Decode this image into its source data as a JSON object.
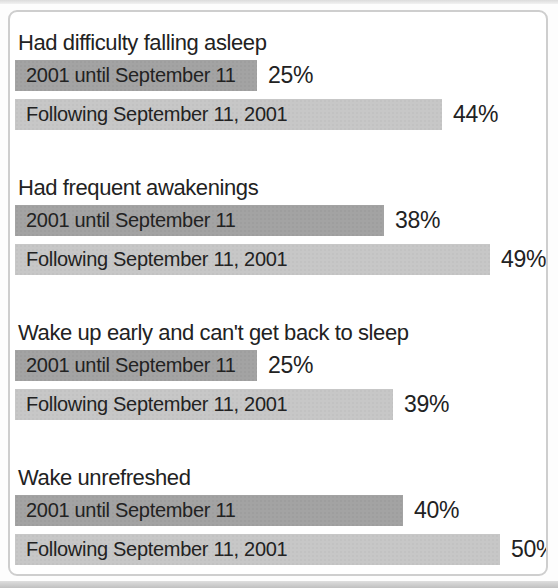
{
  "chart_data": {
    "type": "bar",
    "title": "",
    "unit": "percent",
    "xlim": [
      0,
      52
    ],
    "grid": false,
    "legend_position": "none",
    "series_labels": [
      "2001 until September 11",
      "Following September 11, 2001"
    ],
    "groups": [
      {
        "label": "Had difficulty falling asleep",
        "bars": [
          {
            "series": "2001 until September 11",
            "value": 25,
            "value_label": "25%"
          },
          {
            "series": "Following September 11, 2001",
            "value": 44,
            "value_label": "44%"
          }
        ]
      },
      {
        "label": "Had frequent awakenings",
        "bars": [
          {
            "series": "2001 until September 11",
            "value": 38,
            "value_label": "38%"
          },
          {
            "series": "Following September 11, 2001",
            "value": 49,
            "value_label": "49%"
          }
        ]
      },
      {
        "label": "Wake up early and can't get back to sleep",
        "bars": [
          {
            "series": "2001 until September 11",
            "value": 25,
            "value_label": "25%"
          },
          {
            "series": "Following September 11, 2001",
            "value": 39,
            "value_label": "39%"
          }
        ]
      },
      {
        "label": "Wake unrefreshed",
        "bars": [
          {
            "series": "2001 until September 11",
            "value": 40,
            "value_label": "40%"
          },
          {
            "series": "Following September 11, 2001",
            "value": 50,
            "value_label": "50%"
          }
        ]
      }
    ],
    "colors": {
      "bar_before": "#a3a3a3",
      "bar_after": "#c7c7c7",
      "text": "#222222",
      "frame_border": "#cecece",
      "page_edge": "#c0c0c0"
    }
  }
}
